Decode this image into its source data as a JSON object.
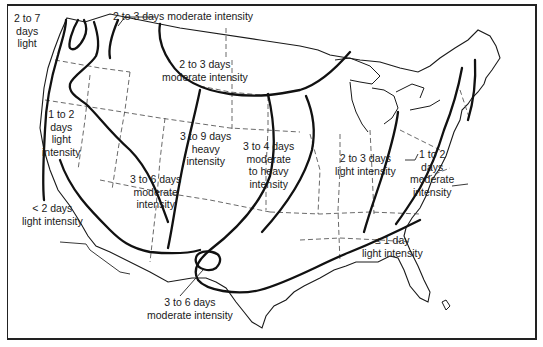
{
  "map": {
    "subject": "United States — duration and intensity zones",
    "colors": {
      "ink": "#1a1a1a",
      "paper": "#ffffff",
      "border": "#222222"
    },
    "labels": {
      "pnw_coast": [
        "2 to 7",
        "days",
        "light"
      ],
      "n_rockies": "2 to 3 days moderate intensity",
      "n_plains": [
        "2 to 3 days",
        "moderate intensity"
      ],
      "great_basin": [
        "1 to 2",
        "days",
        "light",
        "intensity"
      ],
      "s_california": [
        "< 2 days",
        "light intensity"
      ],
      "sw_plateau": [
        "3 to 6 days",
        "moderate",
        "intensity"
      ],
      "c_plains": [
        "3 to 9 days",
        "heavy",
        "intensity"
      ],
      "e_plains": [
        "3 to 4 days",
        "moderate",
        "to heavy",
        "intensity"
      ],
      "ohio_valley": [
        "2 to 3 days",
        "light intensity"
      ],
      "appalachians": [
        "1 to 2",
        "days",
        "moderate",
        "intensity"
      ],
      "southeast": [
        "≤ 1 day",
        "light intensity"
      ],
      "sw_texas": [
        "3 to 6 days",
        "moderate intensity"
      ]
    }
  }
}
